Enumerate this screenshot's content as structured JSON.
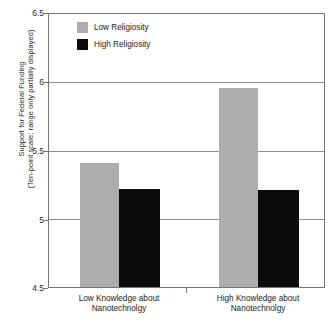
{
  "chart_data": {
    "type": "bar",
    "title": "",
    "subtitle": "",
    "xlabel": "",
    "ylabel": "Support for Federal Funding (Ten-point scale; range only partially displayed)",
    "ylabel_lines": [
      "Support for Federal Funding",
      "(Ten-point scale; range only partially displayed)"
    ],
    "ylim": [
      4.5,
      6.5
    ],
    "ytick_values": [
      6.5,
      6,
      5.5,
      5,
      4.5
    ],
    "ytick_labels": [
      "6.5",
      "6",
      "5.5",
      "5",
      "4.5"
    ],
    "grid": true,
    "legend_position": "top-left-inside",
    "categories": [
      "Low Knowledge about Nanotechnolgy",
      "High Knowledge about Nanotechnolgy"
    ],
    "category_lines": [
      [
        "Low Knowledge about",
        "Nanotechnolgy"
      ],
      [
        "High Knowledge about",
        "Nanotechnolgy"
      ]
    ],
    "series": [
      {
        "name": "Low Religiosity",
        "color": "#adadad",
        "values": [
          5.41,
          5.96
        ]
      },
      {
        "name": "High Religiosity",
        "color": "#0b0b0b",
        "values": [
          5.22,
          5.21
        ]
      }
    ]
  },
  "legend": {
    "items": [
      {
        "label": "Low Religiosity",
        "swatch": "low"
      },
      {
        "label": "High Religiosity",
        "swatch": "high"
      }
    ]
  },
  "colors": {
    "low_religiosity": "#adadad",
    "high_religiosity": "#0b0b0b",
    "gridline": "#8c8c8c",
    "frame": "#767676",
    "background": "#ffffff"
  }
}
